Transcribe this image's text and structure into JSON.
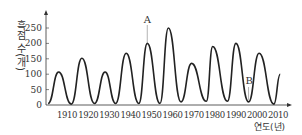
{
  "chart_data": {
    "type": "line",
    "title": "",
    "xlabel": "연도(년)",
    "ylabel": "흑점 수(개)",
    "x_ticks": [
      "1910",
      "1920",
      "1930",
      "1940",
      "1950",
      "1960",
      "1970",
      "1980",
      "1990",
      "2000",
      "2010"
    ],
    "y_ticks": [
      0,
      50,
      100,
      150,
      200,
      250
    ],
    "ylim": [
      0,
      280
    ],
    "xlim": [
      1900,
      2013
    ],
    "grid": false,
    "series": [
      {
        "name": "흑점 수",
        "x": [
          1901,
          1906,
          1912,
          1917,
          1923,
          1928,
          1933,
          1938,
          1944,
          1948,
          1954,
          1958,
          1964,
          1969,
          1976,
          1979,
          1986,
          1990,
          1996,
          2001,
          2008,
          2011
        ],
        "values": [
          5,
          107,
          3,
          152,
          5,
          107,
          5,
          168,
          5,
          200,
          5,
          250,
          10,
          135,
          12,
          190,
          12,
          200,
          10,
          168,
          3,
          100
        ]
      }
    ],
    "annotations": [
      {
        "label": "A",
        "x": 1948,
        "note": "peak near 1948"
      },
      {
        "label": "B",
        "x": 1996,
        "note": "minimum near 1996"
      }
    ]
  }
}
